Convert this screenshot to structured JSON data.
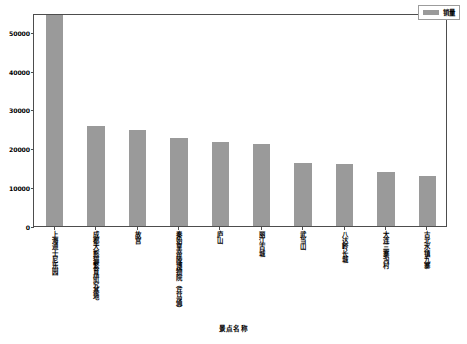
{
  "chart_data": {
    "type": "bar",
    "title": "",
    "subtitle": "",
    "xlabel": "景点名称",
    "ylabel": "",
    "categories": [
      "上海迪士尼乐园",
      "成都大熊猫繁育研究基地",
      "故宫",
      "秦始皇帝陵博物院（兵马俑）",
      "庐山",
      "丽江古城",
      "武当山",
      "八达岭长城",
      "大连三寨沟村",
      "古北水镇九寨"
    ],
    "values": [
      54800,
      25800,
      24700,
      22700,
      21600,
      21300,
      16400,
      16000,
      14000,
      13000
    ],
    "series": [
      {
        "name": "销量",
        "values": [
          54800,
          25800,
          24700,
          22700,
          21600,
          21300,
          16400,
          16000,
          14000,
          13000
        ]
      }
    ],
    "ylim": [
      0,
      55000
    ],
    "yticks": [
      0,
      10000,
      20000,
      30000,
      40000,
      50000
    ],
    "ytick_labels": [
      "0",
      "10000",
      "20000",
      "30000",
      "40000",
      "50000"
    ],
    "grid": false,
    "legend_position": "upper right",
    "bar_color": "#9a9a9a",
    "frame_color": "#4d4d4d"
  },
  "legend": {
    "entries": [
      {
        "label": "销量",
        "color": "#9a9a9a"
      }
    ]
  },
  "axes": {
    "x_title": "景点名称",
    "y_title": ""
  }
}
